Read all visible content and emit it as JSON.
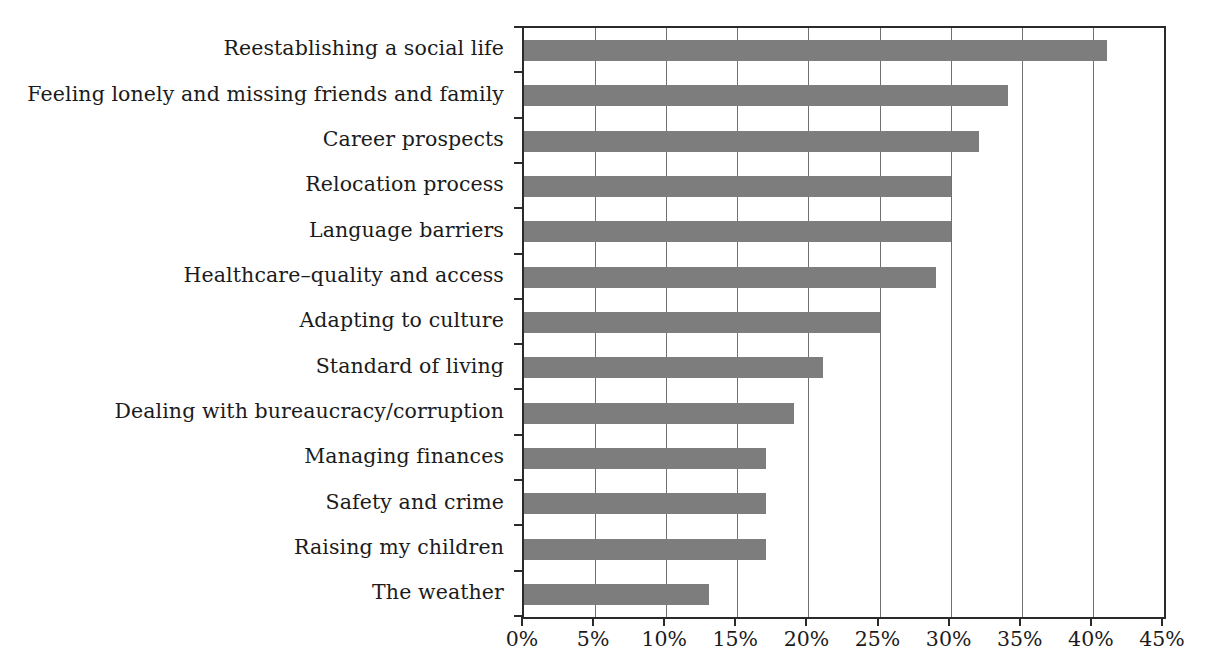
{
  "chart_data": {
    "type": "bar",
    "orientation": "horizontal",
    "title": "",
    "subtitle": "",
    "xlabel": "",
    "ylabel": "",
    "xlim": [
      0,
      45
    ],
    "x_tick_labels": [
      "0%",
      "5%",
      "10%",
      "15%",
      "20%",
      "25%",
      "30%",
      "35%",
      "40%",
      "45%"
    ],
    "x_ticks": [
      0,
      5,
      10,
      15,
      20,
      25,
      30,
      35,
      40,
      45
    ],
    "x_unit": "%",
    "grid": "vertical",
    "legend": "none",
    "bar_color": "#7d7d7d",
    "axis_color": "#2a2a2a",
    "gridline_color": "#6f6f6f",
    "background_color": "#ffffff",
    "categories": [
      "Reestablishing a social life",
      "Feeling lonely and missing friends and family",
      "Career prospects",
      "Relocation process",
      "Language barriers",
      "Healthcare–quality and access",
      "Adapting to culture",
      "Standard of living",
      "Dealing with bureaucracy/corruption",
      "Managing finances",
      "Safety and crime",
      "Raising my children",
      "The weather"
    ],
    "values": [
      41,
      34,
      32,
      30,
      30,
      29,
      25,
      21,
      19,
      17,
      17,
      17,
      13
    ],
    "value_labels": [
      "41%",
      "34%",
      "32%",
      "30%",
      "30%",
      "29%",
      "25%",
      "21%",
      "19%",
      "17%",
      "17%",
      "17%",
      "13%"
    ]
  }
}
